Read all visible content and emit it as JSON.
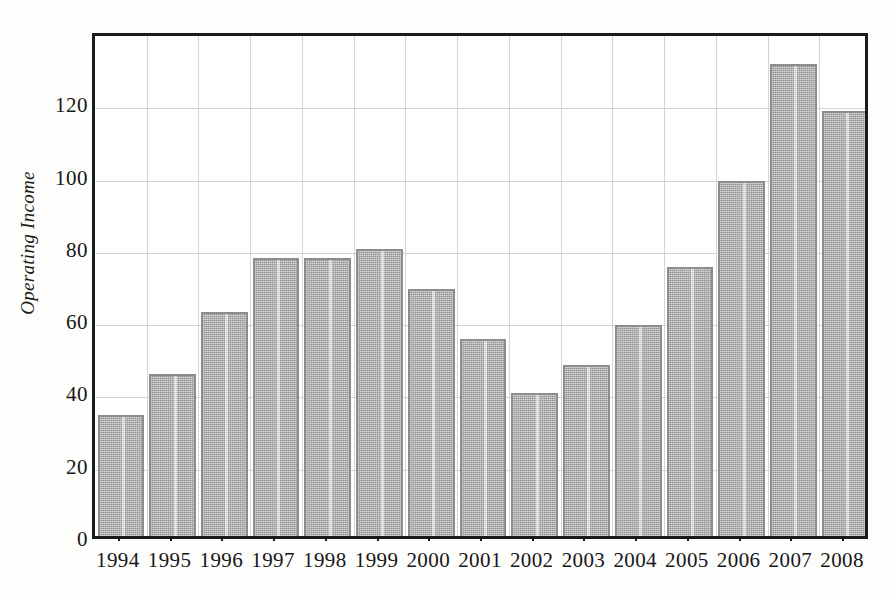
{
  "chart_data": {
    "type": "bar",
    "title": "",
    "subtitle": "",
    "xlabel": "",
    "ylabel": "Operating Income",
    "categories": [
      "1994",
      "1995",
      "1996",
      "1997",
      "1998",
      "1999",
      "2000",
      "2001",
      "2002",
      "2003",
      "2004",
      "2005",
      "2006",
      "2007",
      "2008"
    ],
    "values": [
      33.5,
      44.8,
      62.0,
      77.0,
      77.0,
      79.3,
      68.3,
      54.6,
      39.5,
      47.2,
      58.5,
      74.3,
      98.3,
      130.5,
      117.5
    ],
    "ylim": [
      0,
      140
    ],
    "y_ticks": [
      0,
      20,
      40,
      60,
      80,
      100,
      120
    ],
    "y_tick_labels": [
      "0",
      "20",
      "40",
      "60",
      "80",
      "100",
      "120"
    ],
    "grid": true,
    "grid_axis": "both",
    "legend": null,
    "legend_position": "none",
    "series": [
      {
        "name": "Operating Income",
        "values": [
          33.5,
          44.8,
          62.0,
          77.0,
          77.0,
          79.3,
          68.3,
          54.6,
          39.5,
          47.2,
          58.5,
          74.3,
          98.3,
          130.5,
          117.5
        ]
      }
    ],
    "annotations": []
  },
  "style": {
    "bar_fill": "#a9a9a9",
    "bar_border": "#8c8c8c",
    "gridline_color": "#d4d4d4",
    "frame_color": "#1a1a1a",
    "text_color": "#161616",
    "background": "#ffffff"
  }
}
